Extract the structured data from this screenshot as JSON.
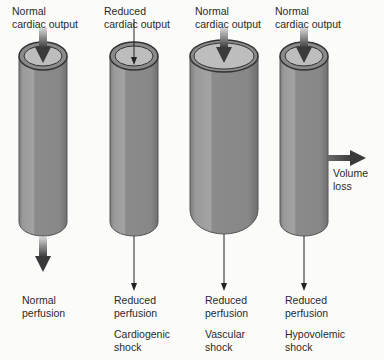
{
  "colors": {
    "background": "#fbfbfa",
    "tube_body": "#8a8a8a",
    "tube_highlight": "#a6a6a6",
    "tube_shadow": "#777777",
    "tube_rim": "#3a3a3a",
    "lumen": "#bdbdbd",
    "arrow": "#3a3a3a",
    "text": "#2a2a2a"
  },
  "columns": [
    {
      "id": "normal",
      "input_label": "Normal\ncardiac output",
      "output_label": "Normal\nperfusion",
      "shock_label": "",
      "input_arrow": "thick",
      "output_arrow": "thick",
      "vessel": "normal"
    },
    {
      "id": "cardiogenic",
      "input_label": "Reduced\ncardiac output",
      "output_label": "Reduced\nperfusion",
      "shock_label": "Cardiogenic\nshock",
      "input_arrow": "thin",
      "output_arrow": "thin",
      "vessel": "normal"
    },
    {
      "id": "vascular",
      "input_label": "Normal\ncardiac output",
      "output_label": "Reduced\nperfusion",
      "shock_label": "Vascular\nshock",
      "input_arrow": "thick",
      "output_arrow": "thin",
      "vessel": "dilated"
    },
    {
      "id": "hypovolemic",
      "input_label": "Normal\ncardiac output",
      "output_label": "Reduced\nperfusion",
      "shock_label": "Hypovolemic\nshock",
      "input_arrow": "thick",
      "output_arrow": "thin",
      "vessel": "normal",
      "side_label": "Volume\nloss"
    }
  ]
}
